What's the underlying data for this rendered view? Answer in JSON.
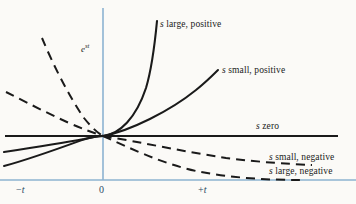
{
  "figure": {
    "background_color": "#fbfaf7",
    "axis_color": "#8db3d1",
    "curve_color": "#1a1a1a",
    "text_color": "#1a1a1a",
    "axis_text_color": "#2b4a63"
  },
  "labels": {
    "y_axis": "e",
    "y_axis_exponent": "st",
    "s_large_positive": "s large, positive",
    "s_small_positive": "s small, positive",
    "s_zero": "s zero",
    "s_small_negative": "s small, negative",
    "s_large_negative": "s large, negative"
  },
  "axis_ticks": {
    "negative_t": "−t",
    "origin": "0",
    "positive_t": "+t"
  },
  "chart_data": {
    "type": "line",
    "title": "",
    "xlabel": "t",
    "ylabel": "e^{st}",
    "subtitle": "",
    "grid": false,
    "legend": "inline-annotations",
    "xlim": [
      -1.0,
      2.0
    ],
    "ylim": [
      0.0,
      4.2
    ],
    "origin_px": [
      103,
      136
    ],
    "axes": {
      "vertical_axis_x_px": 103,
      "horizontal_baseline_y_px": 180,
      "zero_line_y_px": 136
    },
    "series": [
      {
        "name": "s large, positive",
        "label": "s large, positive",
        "style": "solid",
        "formula": "e^{st}, s large positive",
        "domain": "t >= 0",
        "points": [
          [
            0.0,
            0.0
          ],
          [
            0.18,
            0.12
          ],
          [
            0.35,
            0.42
          ],
          [
            0.5,
            0.95
          ],
          [
            0.62,
            1.7
          ],
          [
            0.72,
            2.6
          ],
          [
            0.79,
            3.6
          ]
        ]
      },
      {
        "name": "s small, positive",
        "label": "s small, positive",
        "style": "solid",
        "formula": "e^{st}, s small positive",
        "domain": "t >= 0",
        "points": [
          [
            0.0,
            0.0
          ],
          [
            0.4,
            0.22
          ],
          [
            0.8,
            0.52
          ],
          [
            1.2,
            0.9
          ],
          [
            1.6,
            1.4
          ],
          [
            1.9,
            1.85
          ]
        ]
      },
      {
        "name": "s zero",
        "label": "s zero",
        "style": "solid",
        "formula": "e^{0t} = 1 (constant)",
        "domain": "all t",
        "points": [
          [
            -1.0,
            0.0
          ],
          [
            2.0,
            0.0
          ]
        ]
      },
      {
        "name": "s small, negative",
        "label": "s small, negative",
        "style": "dashed",
        "formula": "e^{st}, s small negative",
        "domain": "t >= 0",
        "points": [
          [
            0.0,
            0.0
          ],
          [
            0.4,
            -0.28
          ],
          [
            0.8,
            -0.5
          ],
          [
            1.2,
            -0.66
          ],
          [
            1.6,
            -0.76
          ],
          [
            2.0,
            -0.82
          ]
        ]
      },
      {
        "name": "s large, negative",
        "label": "s large, negative",
        "style": "dashed",
        "formula": "e^{st}, s large negative",
        "domain": "t >= 0",
        "points": [
          [
            0.0,
            0.0
          ],
          [
            0.35,
            -0.5
          ],
          [
            0.7,
            -0.88
          ],
          [
            1.1,
            -1.15
          ],
          [
            1.5,
            -1.28
          ],
          [
            1.95,
            -1.35
          ]
        ]
      },
      {
        "name": "s large, positive (t<0 branch)",
        "label": "",
        "style": "dashed",
        "formula": "e^{st} continued for t<0",
        "domain": "t <= 0",
        "points": [
          [
            -0.75,
            3.0
          ],
          [
            -0.6,
            2.0
          ],
          [
            -0.45,
            1.25
          ],
          [
            -0.3,
            0.7
          ],
          [
            -0.15,
            0.28
          ],
          [
            0.0,
            0.0
          ]
        ]
      },
      {
        "name": "s small, positive (t<0 branch)",
        "label": "",
        "style": "dashed",
        "formula": "e^{st} continued for t<0",
        "domain": "t <= 0",
        "points": [
          [
            -1.0,
            1.55
          ],
          [
            -0.8,
            1.22
          ],
          [
            -0.6,
            0.9
          ],
          [
            -0.4,
            0.58
          ],
          [
            -0.2,
            0.28
          ],
          [
            0.0,
            0.0
          ]
        ]
      },
      {
        "name": "s small, negative (t<0 branch)",
        "label": "",
        "style": "solid",
        "formula": "e^{st} continued for t<0",
        "domain": "t <= 0",
        "points": [
          [
            -1.0,
            -0.58
          ],
          [
            -0.75,
            -0.45
          ],
          [
            -0.5,
            -0.3
          ],
          [
            -0.25,
            -0.15
          ],
          [
            0.0,
            0.0
          ]
        ]
      },
      {
        "name": "s large, negative (t<0 branch)",
        "label": "",
        "style": "solid",
        "formula": "e^{st} continued for t<0",
        "domain": "t <= 0",
        "points": [
          [
            -1.0,
            -0.92
          ],
          [
            -0.75,
            -0.68
          ],
          [
            -0.5,
            -0.44
          ],
          [
            -0.25,
            -0.21
          ],
          [
            0.0,
            0.0
          ]
        ]
      }
    ]
  }
}
